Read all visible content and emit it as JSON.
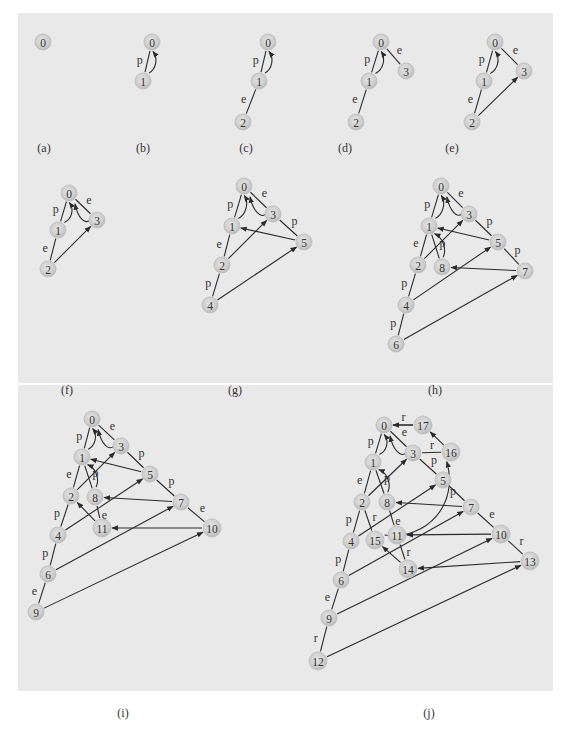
{
  "figure": {
    "colors": {
      "background": "#e9e9e9",
      "node_fill": "#cfcfcf",
      "edge": "#2a2a2a",
      "text": "#333333"
    }
  },
  "panels": [
    {
      "id": "a",
      "caption": "(a)",
      "nodes": [
        {
          "id": "0",
          "label": "0"
        }
      ],
      "edges": []
    },
    {
      "id": "b",
      "caption": "(b)",
      "nodes": [
        {
          "id": "0",
          "label": "0"
        },
        {
          "id": "1",
          "label": "1"
        }
      ],
      "edges": [
        {
          "from": "1",
          "to": "0",
          "label": "p",
          "arrow": false
        },
        {
          "from": "1",
          "to": "0",
          "label": "",
          "arrow": true,
          "curved": true
        }
      ]
    },
    {
      "id": "c",
      "caption": "(c)",
      "nodes": [
        {
          "id": "0",
          "label": "0"
        },
        {
          "id": "1",
          "label": "1"
        },
        {
          "id": "2",
          "label": "2"
        }
      ],
      "edges": [
        {
          "from": "1",
          "to": "0",
          "label": "p",
          "arrow": false
        },
        {
          "from": "1",
          "to": "0",
          "label": "",
          "arrow": true,
          "curved": true
        },
        {
          "from": "2",
          "to": "1",
          "label": "e",
          "arrow": false
        }
      ]
    },
    {
      "id": "d",
      "caption": "(d)",
      "nodes": [
        {
          "id": "0",
          "label": "0"
        },
        {
          "id": "1",
          "label": "1"
        },
        {
          "id": "2",
          "label": "2"
        },
        {
          "id": "3",
          "label": "3"
        }
      ],
      "edges": [
        {
          "from": "1",
          "to": "0",
          "label": "p",
          "arrow": false
        },
        {
          "from": "1",
          "to": "0",
          "label": "",
          "arrow": true,
          "curved": true
        },
        {
          "from": "2",
          "to": "1",
          "label": "e",
          "arrow": false
        },
        {
          "from": "0",
          "to": "3",
          "label": "e",
          "arrow": false
        }
      ]
    },
    {
      "id": "e",
      "caption": "(e)",
      "nodes": [
        {
          "id": "0",
          "label": "0"
        },
        {
          "id": "1",
          "label": "1"
        },
        {
          "id": "2",
          "label": "2"
        },
        {
          "id": "3",
          "label": "3"
        }
      ],
      "edges": [
        {
          "from": "1",
          "to": "0",
          "label": "p",
          "arrow": false
        },
        {
          "from": "1",
          "to": "0",
          "label": "",
          "arrow": true,
          "curved": true
        },
        {
          "from": "2",
          "to": "1",
          "label": "e",
          "arrow": false
        },
        {
          "from": "0",
          "to": "3",
          "label": "e",
          "arrow": false
        },
        {
          "from": "2",
          "to": "3",
          "label": "",
          "arrow": true
        }
      ]
    },
    {
      "id": "f",
      "caption": "(f)",
      "nodes": [
        {
          "id": "0",
          "label": "0"
        },
        {
          "id": "1",
          "label": "1"
        },
        {
          "id": "2",
          "label": "2"
        },
        {
          "id": "3",
          "label": "3"
        }
      ],
      "edges": [
        {
          "from": "1",
          "to": "0",
          "label": "p",
          "arrow": false
        },
        {
          "from": "1",
          "to": "0",
          "label": "",
          "arrow": true,
          "curved": true
        },
        {
          "from": "2",
          "to": "1",
          "label": "e",
          "arrow": false
        },
        {
          "from": "0",
          "to": "3",
          "label": "e",
          "arrow": false
        },
        {
          "from": "2",
          "to": "3",
          "label": "",
          "arrow": true
        },
        {
          "from": "3",
          "to": "0",
          "label": "",
          "arrow": true,
          "curved": true
        }
      ]
    },
    {
      "id": "g",
      "caption": "(g)",
      "nodes": [
        {
          "id": "0",
          "label": "0"
        },
        {
          "id": "1",
          "label": "1"
        },
        {
          "id": "2",
          "label": "2"
        },
        {
          "id": "3",
          "label": "3"
        },
        {
          "id": "4",
          "label": "4"
        },
        {
          "id": "5",
          "label": "5"
        }
      ],
      "edges": [
        {
          "from": "1",
          "to": "0",
          "label": "p",
          "arrow": false
        },
        {
          "from": "1",
          "to": "0",
          "label": "",
          "arrow": true,
          "curved": true
        },
        {
          "from": "2",
          "to": "1",
          "label": "e",
          "arrow": false
        },
        {
          "from": "0",
          "to": "3",
          "label": "e",
          "arrow": false
        },
        {
          "from": "2",
          "to": "3",
          "label": "",
          "arrow": true
        },
        {
          "from": "3",
          "to": "0",
          "label": "",
          "arrow": true,
          "curved": true
        },
        {
          "from": "3",
          "to": "5",
          "label": "p",
          "arrow": false
        },
        {
          "from": "5",
          "to": "1",
          "label": "",
          "arrow": true
        },
        {
          "from": "4",
          "to": "2",
          "label": "p",
          "arrow": false
        },
        {
          "from": "4",
          "to": "5",
          "label": "",
          "arrow": true
        }
      ]
    },
    {
      "id": "h",
      "caption": "(h)",
      "nodes": [
        {
          "id": "0",
          "label": "0"
        },
        {
          "id": "1",
          "label": "1"
        },
        {
          "id": "2",
          "label": "2"
        },
        {
          "id": "3",
          "label": "3"
        },
        {
          "id": "4",
          "label": "4"
        },
        {
          "id": "5",
          "label": "5"
        },
        {
          "id": "6",
          "label": "6"
        },
        {
          "id": "7",
          "label": "7"
        },
        {
          "id": "8",
          "label": "8"
        }
      ],
      "edges": [
        {
          "from": "1",
          "to": "0",
          "label": "p",
          "arrow": false
        },
        {
          "from": "1",
          "to": "0",
          "label": "",
          "arrow": true,
          "curved": true
        },
        {
          "from": "2",
          "to": "1",
          "label": "e",
          "arrow": false
        },
        {
          "from": "0",
          "to": "3",
          "label": "e",
          "arrow": false
        },
        {
          "from": "2",
          "to": "3",
          "label": "",
          "arrow": true
        },
        {
          "from": "3",
          "to": "0",
          "label": "",
          "arrow": true,
          "curved": true
        },
        {
          "from": "3",
          "to": "5",
          "label": "p",
          "arrow": false
        },
        {
          "from": "5",
          "to": "1",
          "label": "",
          "arrow": true
        },
        {
          "from": "4",
          "to": "2",
          "label": "p",
          "arrow": false
        },
        {
          "from": "4",
          "to": "5",
          "label": "",
          "arrow": true
        },
        {
          "from": "1",
          "to": "8",
          "label": "p",
          "arrow": false
        },
        {
          "from": "8",
          "to": "1",
          "label": "",
          "arrow": true,
          "curved": true
        },
        {
          "from": "5",
          "to": "7",
          "label": "p",
          "arrow": false
        },
        {
          "from": "7",
          "to": "8",
          "label": "",
          "arrow": true
        },
        {
          "from": "6",
          "to": "4",
          "label": "p",
          "arrow": false
        },
        {
          "from": "6",
          "to": "7",
          "label": "",
          "arrow": true
        }
      ]
    },
    {
      "id": "i",
      "caption": "(i)",
      "nodes": [
        {
          "id": "0",
          "label": "0"
        },
        {
          "id": "1",
          "label": "1"
        },
        {
          "id": "2",
          "label": "2"
        },
        {
          "id": "3",
          "label": "3"
        },
        {
          "id": "4",
          "label": "4"
        },
        {
          "id": "5",
          "label": "5"
        },
        {
          "id": "6",
          "label": "6"
        },
        {
          "id": "7",
          "label": "7"
        },
        {
          "id": "8",
          "label": "8"
        },
        {
          "id": "9",
          "label": "9"
        },
        {
          "id": "10",
          "label": "10"
        },
        {
          "id": "11",
          "label": "11"
        }
      ],
      "edges": [
        {
          "from": "1",
          "to": "0",
          "label": "p",
          "arrow": false
        },
        {
          "from": "1",
          "to": "0",
          "label": "",
          "arrow": true,
          "curved": true
        },
        {
          "from": "2",
          "to": "1",
          "label": "e",
          "arrow": false
        },
        {
          "from": "0",
          "to": "3",
          "label": "e",
          "arrow": false
        },
        {
          "from": "2",
          "to": "3",
          "label": "",
          "arrow": true
        },
        {
          "from": "3",
          "to": "0",
          "label": "",
          "arrow": true,
          "curved": true
        },
        {
          "from": "3",
          "to": "5",
          "label": "p",
          "arrow": false
        },
        {
          "from": "5",
          "to": "1",
          "label": "",
          "arrow": true
        },
        {
          "from": "4",
          "to": "2",
          "label": "p",
          "arrow": false
        },
        {
          "from": "4",
          "to": "5",
          "label": "",
          "arrow": true
        },
        {
          "from": "1",
          "to": "8",
          "label": "p",
          "arrow": false
        },
        {
          "from": "8",
          "to": "1",
          "label": "",
          "arrow": true,
          "curved": true
        },
        {
          "from": "5",
          "to": "7",
          "label": "p",
          "arrow": false
        },
        {
          "from": "7",
          "to": "8",
          "label": "",
          "arrow": true
        },
        {
          "from": "6",
          "to": "4",
          "label": "p",
          "arrow": false
        },
        {
          "from": "6",
          "to": "7",
          "label": "",
          "arrow": true
        },
        {
          "from": "8",
          "to": "11",
          "label": "e",
          "arrow": false
        },
        {
          "from": "11",
          "to": "2",
          "label": "",
          "arrow": true
        },
        {
          "from": "7",
          "to": "10",
          "label": "e",
          "arrow": false
        },
        {
          "from": "10",
          "to": "11",
          "label": "",
          "arrow": true
        },
        {
          "from": "9",
          "to": "6",
          "label": "e",
          "arrow": false
        },
        {
          "from": "9",
          "to": "10",
          "label": "",
          "arrow": true
        }
      ]
    },
    {
      "id": "j",
      "caption": "(j)",
      "nodes": [
        {
          "id": "0",
          "label": "0"
        },
        {
          "id": "1",
          "label": "1"
        },
        {
          "id": "2",
          "label": "2"
        },
        {
          "id": "3",
          "label": "3"
        },
        {
          "id": "4",
          "label": "4"
        },
        {
          "id": "5",
          "label": "5"
        },
        {
          "id": "6",
          "label": "6"
        },
        {
          "id": "7",
          "label": "7"
        },
        {
          "id": "8",
          "label": "8"
        },
        {
          "id": "9",
          "label": "9"
        },
        {
          "id": "10",
          "label": "10"
        },
        {
          "id": "11",
          "label": "11"
        },
        {
          "id": "12",
          "label": "12"
        },
        {
          "id": "13",
          "label": "13"
        },
        {
          "id": "14",
          "label": "14"
        },
        {
          "id": "15",
          "label": "15"
        },
        {
          "id": "16",
          "label": "16"
        },
        {
          "id": "17",
          "label": "17"
        }
      ],
      "edges": [
        {
          "from": "1",
          "to": "0",
          "label": "p",
          "arrow": false
        },
        {
          "from": "1",
          "to": "0",
          "label": "",
          "arrow": true,
          "curved": true
        },
        {
          "from": "2",
          "to": "1",
          "label": "e",
          "arrow": false
        },
        {
          "from": "0",
          "to": "3",
          "label": "e",
          "arrow": false
        },
        {
          "from": "2",
          "to": "3",
          "label": "",
          "arrow": true
        },
        {
          "from": "3",
          "to": "0",
          "label": "",
          "arrow": true,
          "curved": true
        },
        {
          "from": "3",
          "to": "5",
          "label": "p",
          "arrow": false
        },
        {
          "from": "4",
          "to": "2",
          "label": "p",
          "arrow": false
        },
        {
          "from": "4",
          "to": "5",
          "label": "",
          "arrow": true
        },
        {
          "from": "1",
          "to": "8",
          "label": "p",
          "arrow": false
        },
        {
          "from": "8",
          "to": "1",
          "label": "",
          "arrow": true,
          "curved": true
        },
        {
          "from": "5",
          "to": "7",
          "label": "",
          "arrow": false
        },
        {
          "from": "7",
          "to": "8",
          "label": "",
          "arrow": true
        },
        {
          "from": "6",
          "to": "4",
          "label": "p",
          "arrow": false
        },
        {
          "from": "6",
          "to": "7",
          "label": "",
          "arrow": true
        },
        {
          "from": "8",
          "to": "11",
          "label": "e",
          "arrow": false
        },
        {
          "from": "7",
          "to": "10",
          "label": "e",
          "arrow": false
        },
        {
          "from": "10",
          "to": "11",
          "label": "",
          "arrow": true
        },
        {
          "from": "9",
          "to": "6",
          "label": "e",
          "arrow": false
        },
        {
          "from": "9",
          "to": "10",
          "label": "",
          "arrow": true
        },
        {
          "from": "12",
          "to": "9",
          "label": "r",
          "arrow": false
        },
        {
          "from": "12",
          "to": "13",
          "label": "",
          "arrow": true
        },
        {
          "from": "10",
          "to": "13",
          "label": "r",
          "arrow": false
        },
        {
          "from": "13",
          "to": "14",
          "label": "",
          "arrow": true
        },
        {
          "from": "11",
          "to": "14",
          "label": "r",
          "arrow": false
        },
        {
          "from": "14",
          "to": "15",
          "label": "",
          "arrow": true
        },
        {
          "from": "2",
          "to": "15",
          "label": "r",
          "arrow": false
        },
        {
          "from": "15",
          "to": "16",
          "label": "p",
          "arrow": true,
          "curved": true
        },
        {
          "from": "3",
          "to": "16",
          "label": "r",
          "arrow": false
        },
        {
          "from": "16",
          "to": "17",
          "label": "",
          "arrow": true
        },
        {
          "from": "0",
          "to": "17",
          "label": "r",
          "arrow": false
        },
        {
          "from": "17",
          "to": "0",
          "label": "",
          "arrow": true
        }
      ]
    }
  ]
}
